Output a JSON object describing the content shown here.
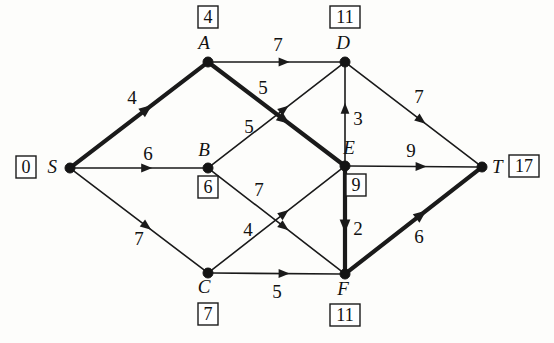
{
  "diagram": {
    "background_color": "#fdfdfb",
    "ink_color": "#1a1a1a",
    "nodes": [
      {
        "id": "S",
        "label": "S",
        "distance": "0",
        "x": 70,
        "y": 168,
        "label_dx": -13,
        "label_dy": 5,
        "box_side": "left-of-label"
      },
      {
        "id": "A",
        "label": "A",
        "distance": "4",
        "x": 208,
        "y": 62,
        "label_dx": -4,
        "label_dy": -13,
        "box_side": "above"
      },
      {
        "id": "B",
        "label": "B",
        "distance": "6",
        "x": 208,
        "y": 168,
        "label_dx": -4,
        "label_dy": -12,
        "box_side": "below"
      },
      {
        "id": "C",
        "label": "C",
        "distance": "7",
        "x": 208,
        "y": 273,
        "label_dx": -4,
        "label_dy": 20,
        "box_side": "below"
      },
      {
        "id": "D",
        "label": "D",
        "distance": "11",
        "x": 345,
        "y": 62,
        "label_dx": -2,
        "label_dy": -13,
        "box_side": "above"
      },
      {
        "id": "E",
        "label": "E",
        "distance": "9",
        "x": 345,
        "y": 166,
        "label_dx": 4,
        "label_dy": -12,
        "box_side": "below"
      },
      {
        "id": "F",
        "label": "F",
        "distance": "11",
        "x": 345,
        "y": 274,
        "label_dx": -2,
        "label_dy": 21,
        "box_side": "below"
      },
      {
        "id": "T",
        "label": "T",
        "distance": "17",
        "x": 482,
        "y": 167,
        "label_dx": 10,
        "label_dy": 6,
        "box_side": "right-of-label"
      }
    ],
    "edges": [
      {
        "from": "S",
        "to": "A",
        "weight": "4",
        "bold": true,
        "label_x": 132,
        "label_y": 104
      },
      {
        "from": "S",
        "to": "B",
        "weight": "6",
        "bold": false,
        "label_x": 148,
        "label_y": 160
      },
      {
        "from": "S",
        "to": "C",
        "weight": "7",
        "bold": false,
        "label_x": 139,
        "label_y": 245
      },
      {
        "from": "A",
        "to": "D",
        "weight": "7",
        "bold": false,
        "label_x": 278,
        "label_y": 51
      },
      {
        "from": "A",
        "to": "E",
        "weight": "5",
        "bold": true,
        "label_x": 263,
        "label_y": 94
      },
      {
        "from": "B",
        "to": "D",
        "weight": "5",
        "bold": false,
        "label_x": 249,
        "label_y": 133
      },
      {
        "from": "B",
        "to": "F",
        "weight": "7",
        "bold": false,
        "label_x": 259,
        "label_y": 196
      },
      {
        "from": "C",
        "to": "E",
        "weight": "4",
        "bold": false,
        "label_x": 248,
        "label_y": 236
      },
      {
        "from": "C",
        "to": "F",
        "weight": "5",
        "bold": false,
        "label_x": 277,
        "label_y": 298
      },
      {
        "from": "E",
        "to": "D",
        "weight": "3",
        "bold": false,
        "label_x": 358,
        "label_y": 125
      },
      {
        "from": "E",
        "to": "F",
        "weight": "2",
        "bold": true,
        "label_x": 358,
        "label_y": 235
      },
      {
        "from": "E",
        "to": "T",
        "weight": "9",
        "bold": false,
        "label_x": 411,
        "label_y": 157
      },
      {
        "from": "D",
        "to": "T",
        "weight": "7",
        "bold": false,
        "label_x": 419,
        "label_y": 103
      },
      {
        "from": "F",
        "to": "T",
        "weight": "6",
        "bold": true,
        "label_x": 419,
        "label_y": 243
      }
    ]
  },
  "chart_data": {
    "type": "diagram",
    "nodes": [
      "S",
      "A",
      "B",
      "C",
      "D",
      "E",
      "F",
      "T"
    ],
    "node_distances": {
      "S": 0,
      "A": 4,
      "B": 6,
      "C": 7,
      "D": 11,
      "E": 9,
      "F": 11,
      "T": 17
    },
    "edges": [
      {
        "from": "S",
        "to": "A",
        "weight": 4,
        "in_tree": true
      },
      {
        "from": "S",
        "to": "B",
        "weight": 6,
        "in_tree": false
      },
      {
        "from": "S",
        "to": "C",
        "weight": 7,
        "in_tree": false
      },
      {
        "from": "A",
        "to": "D",
        "weight": 7,
        "in_tree": false
      },
      {
        "from": "A",
        "to": "E",
        "weight": 5,
        "in_tree": true
      },
      {
        "from": "B",
        "to": "D",
        "weight": 5,
        "in_tree": false
      },
      {
        "from": "B",
        "to": "F",
        "weight": 7,
        "in_tree": false
      },
      {
        "from": "C",
        "to": "E",
        "weight": 4,
        "in_tree": false
      },
      {
        "from": "C",
        "to": "F",
        "weight": 5,
        "in_tree": false
      },
      {
        "from": "E",
        "to": "D",
        "weight": 3,
        "in_tree": false
      },
      {
        "from": "E",
        "to": "F",
        "weight": 2,
        "in_tree": true
      },
      {
        "from": "E",
        "to": "T",
        "weight": 9,
        "in_tree": false
      },
      {
        "from": "D",
        "to": "T",
        "weight": 7,
        "in_tree": false
      },
      {
        "from": "F",
        "to": "T",
        "weight": 6,
        "in_tree": true
      }
    ],
    "highlighted_path": [
      "S",
      "A",
      "E",
      "F",
      "T"
    ],
    "highlighted_path_total": 17
  }
}
